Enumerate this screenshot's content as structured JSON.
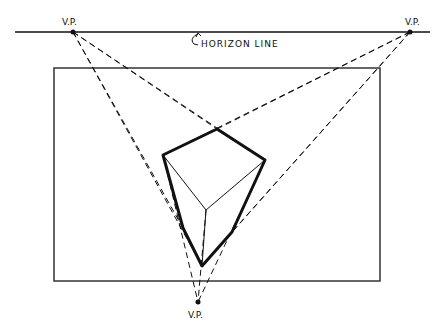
{
  "diagram": {
    "labels": {
      "vp_left": "V.P.",
      "vp_right": "V.P.",
      "vp_bottom": "V.P.",
      "horizon": "HORIZON LINE"
    },
    "colors": {
      "ink": "#111111",
      "frame": "#333333",
      "background": "#ffffff"
    }
  }
}
